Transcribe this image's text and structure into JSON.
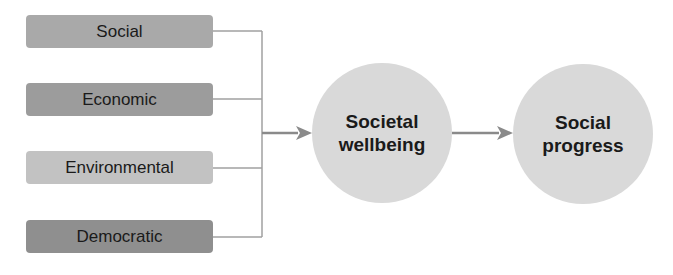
{
  "inputs": [
    {
      "label": "Social",
      "color": "#a9a9a9",
      "top": 15
    },
    {
      "label": "Economic",
      "color": "#9c9c9c",
      "top": 83
    },
    {
      "label": "Environmental",
      "color": "#c2c2c2",
      "top": 151
    },
    {
      "label": "Democratic",
      "color": "#8f8f8f",
      "top": 220
    }
  ],
  "nodes": {
    "wellbeing": {
      "line1": "Societal",
      "line2": "wellbeing"
    },
    "progress": {
      "line1": "Social",
      "line2": "progress"
    }
  },
  "colors": {
    "connector": "#a0a0a0",
    "arrow": "#8a8a8a",
    "circle": "#d9d9d9"
  }
}
